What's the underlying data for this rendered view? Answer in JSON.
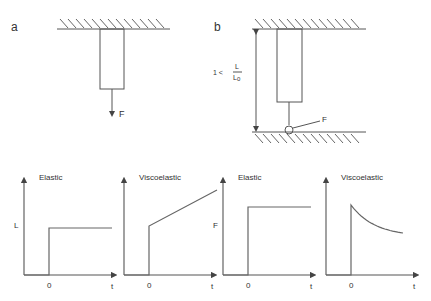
{
  "panels": {
    "a": {
      "label": "a",
      "force_label": "F"
    },
    "b": {
      "label": "b",
      "force_label": "F",
      "ratio_prefix": "1 <",
      "ratio_numerator": "L",
      "ratio_denominator": "L",
      "ratio_subscript": "0"
    }
  },
  "graphs": [
    {
      "title": "Elastic",
      "ylabel": "L",
      "xlabel": "t",
      "origin_label": "0",
      "behavior": "step"
    },
    {
      "title": "Viscoelastic",
      "ylabel": "",
      "xlabel": "t",
      "origin_label": "0",
      "behavior": "step-then-linear-increase"
    },
    {
      "title": "Elastic",
      "ylabel": "F",
      "xlabel": "t",
      "origin_label": "0",
      "behavior": "step"
    },
    {
      "title": "Viscoelastic",
      "ylabel": "",
      "xlabel": "t",
      "origin_label": "0",
      "behavior": "step-then-exponential-decay"
    }
  ]
}
